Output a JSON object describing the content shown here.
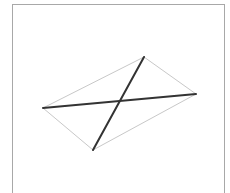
{
  "diagram": {
    "type": "quadrilateral-with-diagonals",
    "vertices": {
      "top": [
        144,
        57
      ],
      "right": [
        196,
        94
      ],
      "bottom": [
        93,
        150
      ],
      "left": [
        43,
        108
      ]
    },
    "edges_color": "#c8c8c8",
    "diagonals_color": "#333333",
    "frame_color": "#a8a8a8"
  }
}
